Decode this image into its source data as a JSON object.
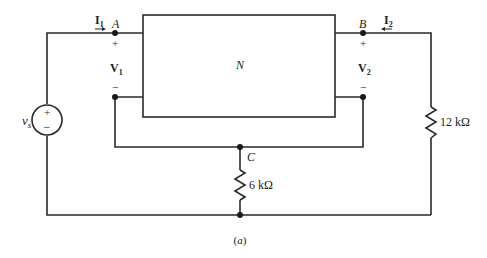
{
  "diagram": {
    "caption": "(a)",
    "network_label": "N",
    "source": {
      "label": "v",
      "subscript": "s",
      "plus": "+",
      "minus": "−"
    },
    "nodes": {
      "A": "A",
      "B": "B",
      "C": "C"
    },
    "currents": {
      "I1": {
        "label": "I",
        "subscript": "1",
        "direction": "right"
      },
      "I2": {
        "label": "I",
        "subscript": "2",
        "direction": "left"
      }
    },
    "voltages": {
      "V1": {
        "label": "V",
        "subscript": "1",
        "plus": "+",
        "minus": "−"
      },
      "V2": {
        "label": "V",
        "subscript": "2",
        "plus": "+",
        "minus": "−"
      }
    },
    "resistors": {
      "R_load": {
        "label": "12 kΩ"
      },
      "R_common": {
        "label": "6 kΩ"
      }
    }
  }
}
